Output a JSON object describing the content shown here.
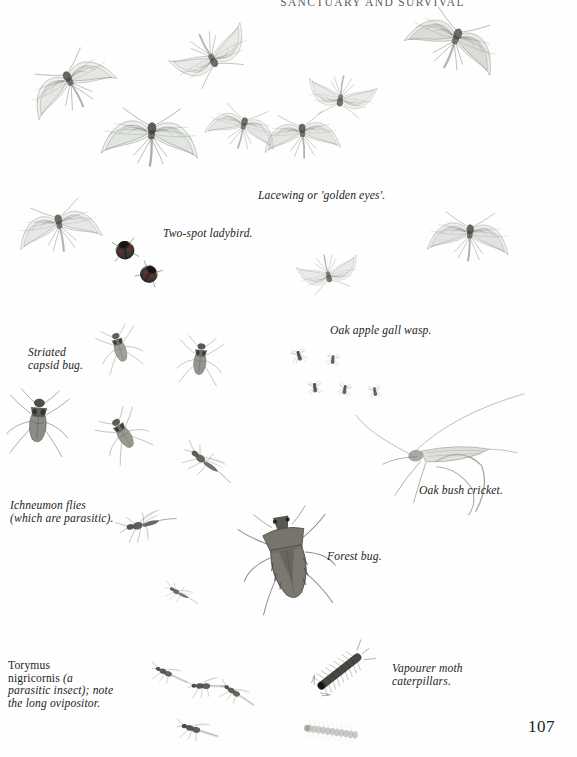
{
  "page": {
    "running_head": "SANCTUARY AND SURVIVAL",
    "folio": "107",
    "background_color": "#fefefe",
    "text_color": "#262422"
  },
  "captions": [
    {
      "id": "lacewing",
      "text": "Lacewing or 'golden eyes'.",
      "x": 258,
      "y": 190,
      "width": 150,
      "align": "left"
    },
    {
      "id": "two-spot",
      "text": "Two-spot ladybird.",
      "x": 163,
      "y": 228,
      "width": 120,
      "align": "left"
    },
    {
      "id": "striated",
      "text": "Striated\ncapsid bug.",
      "x": 28,
      "y": 347,
      "width": 100,
      "align": "left"
    },
    {
      "id": "gall-wasp",
      "text": "Oak apple gall wasp.",
      "x": 330,
      "y": 325,
      "width": 130,
      "align": "left"
    },
    {
      "id": "ichneumon",
      "text": "Ichneumon flies\n(which are parasitic).",
      "x": 10,
      "y": 500,
      "width": 130,
      "align": "left"
    },
    {
      "id": "bush-cricket",
      "text": "Oak bush cricket.",
      "x": 419,
      "y": 485,
      "width": 120,
      "align": "left"
    },
    {
      "id": "forest-bug",
      "text": "Forest bug.",
      "x": 327,
      "y": 551,
      "width": 90,
      "align": "left"
    },
    {
      "id": "vapourer",
      "text": "Vapourer moth\ncaterpillars.",
      "x": 392,
      "y": 663,
      "width": 120,
      "align": "left"
    }
  ],
  "torymus_caption": {
    "id": "torymus",
    "x": 8,
    "y": 660,
    "width": 118,
    "species": "Torymus\nnigricornis ",
    "rest": "(a\nparasitic insect); note\nthe long ovipositor."
  },
  "specimens": [
    {
      "name": "lacewing-upper-left",
      "x": 30,
      "y": 52,
      "scale": 1.0,
      "rot": -28,
      "kind": "lacewing",
      "wing": "#cfd2cb",
      "body": "#4a4742"
    },
    {
      "name": "lacewing-top-centre",
      "x": 160,
      "y": 10,
      "scale": 0.92,
      "rot": 152,
      "kind": "lacewing",
      "wing": "#d3d6cf",
      "body": "#54514b"
    },
    {
      "name": "lacewing-top-right",
      "x": 406,
      "y": 12,
      "scale": 1.05,
      "rot": 22,
      "kind": "lacewing",
      "wing": "#b9bdb4",
      "body": "#4f4c46"
    },
    {
      "name": "lacewing-mid-upper",
      "x": 295,
      "y": 50,
      "scale": 0.78,
      "rot": 188,
      "kind": "lacewing",
      "wing": "#d6d9d2",
      "body": "#58554f"
    },
    {
      "name": "lacewing-centre-large",
      "x": 106,
      "y": 108,
      "scale": 1.1,
      "rot": 3,
      "kind": "lacewing",
      "wing": "#c8ccc4",
      "body": "#3f3c37"
    },
    {
      "name": "lacewing-mid-left-small",
      "x": 196,
      "y": 96,
      "scale": 0.8,
      "rot": 14,
      "kind": "lacewing",
      "wing": "#d2d5ce",
      "body": "#55524c"
    },
    {
      "name": "lacewing-mid-right",
      "x": 258,
      "y": 104,
      "scale": 0.86,
      "rot": -4,
      "kind": "lacewing",
      "wing": "#cbcfc7",
      "body": "#4b4843"
    },
    {
      "name": "lacewing-lower-left",
      "x": 16,
      "y": 196,
      "scale": 0.94,
      "rot": -10,
      "kind": "lacewing",
      "wing": "#d0d3cc",
      "body": "#504d47"
    },
    {
      "name": "lacewing-lower-centre",
      "x": 280,
      "y": 228,
      "scale": 0.7,
      "rot": 168,
      "kind": "lacewing",
      "wing": "#d8dbd4",
      "body": "#5b5852"
    },
    {
      "name": "lacewing-lower-right",
      "x": 424,
      "y": 206,
      "scale": 0.92,
      "rot": 4,
      "kind": "lacewing",
      "wing": "#c6cac2",
      "body": "#474440"
    },
    {
      "name": "ladybird-upper",
      "x": 112,
      "y": 238,
      "scale": 1.0,
      "rot": -12,
      "kind": "ladybird",
      "wing": "#2e2a27",
      "body": "#241f1c"
    },
    {
      "name": "ladybird-lower",
      "x": 136,
      "y": 262,
      "scale": 0.94,
      "rot": 28,
      "kind": "ladybird",
      "wing": "#342b28",
      "body": "#241f1c"
    },
    {
      "name": "capsid-bug-upper",
      "x": 92,
      "y": 318,
      "scale": 0.8,
      "rot": -18,
      "kind": "capsid",
      "wing": "#8b8a84",
      "body": "#504d47"
    },
    {
      "name": "capsid-bug-right",
      "x": 172,
      "y": 330,
      "scale": 0.86,
      "rot": 6,
      "kind": "capsid",
      "wing": "#7e7d77",
      "body": "#4a4742"
    },
    {
      "name": "capsid-bug-big-left",
      "x": 10,
      "y": 392,
      "scale": 1.18,
      "rot": 4,
      "kind": "capsid",
      "wing": "#74736d",
      "body": "#3c3935"
    },
    {
      "name": "capsid-bug-mid",
      "x": 96,
      "y": 404,
      "scale": 0.88,
      "rot": -32,
      "kind": "capsid",
      "wing": "#838279",
      "body": "#4e4b45"
    },
    {
      "name": "gall-wasp-1",
      "x": 282,
      "y": 340,
      "scale": 0.52,
      "rot": -14,
      "kind": "wasp",
      "wing": "#9a9992",
      "body": "#3a3733"
    },
    {
      "name": "gall-wasp-2",
      "x": 316,
      "y": 344,
      "scale": 0.46,
      "rot": 8,
      "kind": "wasp",
      "wing": "#a09f98",
      "body": "#433f3b"
    },
    {
      "name": "gall-wasp-3",
      "x": 298,
      "y": 372,
      "scale": 0.5,
      "rot": -4,
      "kind": "wasp",
      "wing": "#97968f",
      "body": "#3d3a36"
    },
    {
      "name": "gall-wasp-4",
      "x": 328,
      "y": 374,
      "scale": 0.48,
      "rot": 12,
      "kind": "wasp",
      "wing": "#9d9c95",
      "body": "#413d39"
    },
    {
      "name": "gall-wasp-5",
      "x": 358,
      "y": 376,
      "scale": 0.46,
      "rot": -8,
      "kind": "wasp",
      "wing": "#a3a29b",
      "body": "#46423e"
    },
    {
      "name": "ichneumon-upper",
      "x": 172,
      "y": 448,
      "scale": 0.9,
      "rot": 34,
      "kind": "ichneumon",
      "wing": "#a8a7a0",
      "body": "#4f4c47"
    },
    {
      "name": "ichneumon-lower",
      "x": 112,
      "y": 508,
      "scale": 0.92,
      "rot": -16,
      "kind": "ichneumon",
      "wing": "#9e9d96",
      "body": "#45423d"
    },
    {
      "name": "ichneumon-tiny",
      "x": 146,
      "y": 578,
      "scale": 0.58,
      "rot": 24,
      "kind": "ichneumon",
      "wing": "#b0afa8",
      "body": "#56534e"
    },
    {
      "name": "bush-cricket",
      "x": 378,
      "y": 412,
      "scale": 1.25,
      "rot": -8,
      "kind": "cricket",
      "wing": "#c3c6bd",
      "body": "#6e716a"
    },
    {
      "name": "forest-bug",
      "x": 252,
      "y": 516,
      "scale": 1.3,
      "rot": -10,
      "kind": "shieldbug",
      "wing": "#6f6d64",
      "body": "#474540"
    },
    {
      "name": "torymus-1",
      "x": 140,
      "y": 660,
      "scale": 0.74,
      "rot": 18,
      "kind": "torymus",
      "wing": "#9b9a93",
      "body": "#413e39"
    },
    {
      "name": "torymus-2",
      "x": 178,
      "y": 672,
      "scale": 0.8,
      "rot": -6,
      "kind": "torymus",
      "wing": "#93928b",
      "body": "#3b3834"
    },
    {
      "name": "torymus-3",
      "x": 208,
      "y": 680,
      "scale": 0.76,
      "rot": 26,
      "kind": "torymus",
      "wing": "#9f9e97",
      "body": "#454239"
    },
    {
      "name": "torymus-4",
      "x": 168,
      "y": 716,
      "scale": 0.82,
      "rot": 10,
      "kind": "torymus",
      "wing": "#8f8e87",
      "body": "#3a3733"
    },
    {
      "name": "caterpillar-upper",
      "x": 308,
      "y": 655,
      "scale": 1.0,
      "rot": -38,
      "kind": "caterpillar",
      "wing": "#55524b",
      "body": "#3a3733"
    },
    {
      "name": "caterpillar-lower",
      "x": 300,
      "y": 722,
      "scale": 0.92,
      "rot": 8,
      "kind": "caterpillar-pale",
      "wing": "#b9b8b1",
      "body": "#8d8c85"
    }
  ]
}
